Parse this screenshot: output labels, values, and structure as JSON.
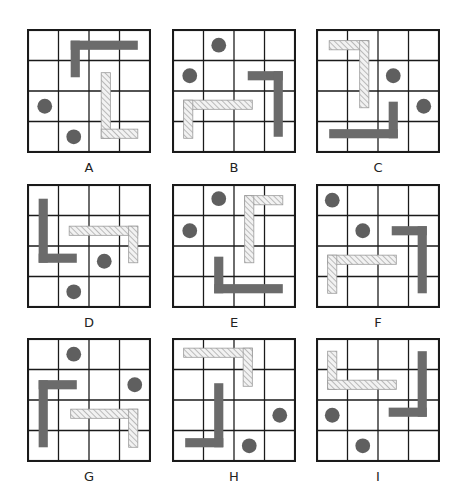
{
  "puzzle": {
    "grid_size": 4,
    "colors": {
      "grid_line": "#1a1a1a",
      "solid": "#6b6b6b",
      "hatch_stroke": "#9a9a9a",
      "hatch_fill": "#f2f2f2",
      "dot": "#5f5f5f"
    },
    "panels": [
      {
        "label": "A",
        "x": 27,
        "y": 29,
        "solid": [
          [
            1.4,
            0.35,
            3.6,
            0.65
          ],
          [
            1.4,
            0.35,
            1.7,
            1.55
          ]
        ],
        "hatched": [
          [
            2.4,
            1.4,
            2.7,
            3.55
          ],
          [
            2.4,
            3.25,
            3.6,
            3.55
          ]
        ],
        "dots": [
          [
            0.55,
            2.5
          ],
          [
            1.5,
            3.5
          ]
        ]
      },
      {
        "label": "B",
        "x": 172,
        "y": 29,
        "solid": [
          [
            2.45,
            1.35,
            3.6,
            1.65
          ],
          [
            3.3,
            1.35,
            3.6,
            3.5
          ]
        ],
        "hatched": [
          [
            0.35,
            2.3,
            2.6,
            2.6
          ],
          [
            0.35,
            2.3,
            0.65,
            3.55
          ]
        ],
        "dots": [
          [
            1.5,
            0.5
          ],
          [
            0.55,
            1.5
          ]
        ]
      },
      {
        "label": "C",
        "x": 316,
        "y": 29,
        "solid": [
          [
            2.35,
            2.35,
            2.65,
            3.55
          ],
          [
            0.4,
            3.25,
            2.65,
            3.55
          ]
        ],
        "hatched": [
          [
            0.4,
            0.35,
            1.7,
            0.65
          ],
          [
            1.4,
            0.35,
            1.7,
            2.55
          ]
        ],
        "dots": [
          [
            2.5,
            1.5
          ],
          [
            3.5,
            2.5
          ]
        ]
      },
      {
        "label": "D",
        "x": 27,
        "y": 184,
        "solid": [
          [
            0.35,
            0.45,
            0.65,
            2.55
          ],
          [
            0.35,
            2.25,
            1.6,
            2.55
          ]
        ],
        "hatched": [
          [
            1.35,
            1.35,
            3.6,
            1.65
          ],
          [
            3.3,
            1.35,
            3.6,
            2.55
          ]
        ],
        "dots": [
          [
            2.5,
            2.5
          ],
          [
            1.5,
            3.5
          ]
        ]
      },
      {
        "label": "E",
        "x": 172,
        "y": 184,
        "solid": [
          [
            1.35,
            2.35,
            1.65,
            3.55
          ],
          [
            1.35,
            3.25,
            3.6,
            3.55
          ]
        ],
        "hatched": [
          [
            2.35,
            0.35,
            3.6,
            0.65
          ],
          [
            2.35,
            0.35,
            2.65,
            2.55
          ]
        ],
        "dots": [
          [
            1.5,
            0.45
          ],
          [
            0.55,
            1.5
          ]
        ]
      },
      {
        "label": "F",
        "x": 316,
        "y": 184,
        "solid": [
          [
            2.45,
            1.35,
            3.6,
            1.65
          ],
          [
            3.3,
            1.35,
            3.6,
            3.55
          ]
        ],
        "hatched": [
          [
            0.35,
            2.3,
            2.6,
            2.6
          ],
          [
            0.35,
            2.3,
            0.65,
            3.55
          ]
        ],
        "dots": [
          [
            0.5,
            0.5
          ],
          [
            1.5,
            1.5
          ]
        ]
      },
      {
        "label": "G",
        "x": 27,
        "y": 338,
        "solid": [
          [
            0.35,
            1.35,
            1.6,
            1.65
          ],
          [
            0.35,
            1.35,
            0.65,
            3.55
          ]
        ],
        "hatched": [
          [
            1.4,
            2.3,
            3.6,
            2.6
          ],
          [
            3.3,
            2.3,
            3.6,
            3.55
          ]
        ],
        "dots": [
          [
            1.5,
            0.5
          ],
          [
            3.5,
            1.5
          ]
        ]
      },
      {
        "label": "H",
        "x": 172,
        "y": 338,
        "solid": [
          [
            1.35,
            1.45,
            1.65,
            3.55
          ],
          [
            0.4,
            3.25,
            1.65,
            3.55
          ]
        ],
        "hatched": [
          [
            0.35,
            0.3,
            2.6,
            0.6
          ],
          [
            2.3,
            0.3,
            2.6,
            1.55
          ]
        ],
        "dots": [
          [
            3.5,
            2.5
          ],
          [
            2.5,
            3.5
          ]
        ]
      },
      {
        "label": "I",
        "x": 316,
        "y": 338,
        "solid": [
          [
            3.3,
            0.4,
            3.6,
            2.55
          ],
          [
            2.35,
            2.25,
            3.6,
            2.55
          ]
        ],
        "hatched": [
          [
            0.35,
            0.4,
            0.65,
            1.65
          ],
          [
            0.35,
            1.35,
            2.6,
            1.65
          ]
        ],
        "dots": [
          [
            0.5,
            2.5
          ],
          [
            1.5,
            3.5
          ]
        ]
      }
    ]
  }
}
